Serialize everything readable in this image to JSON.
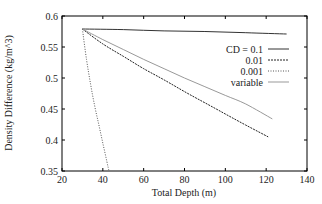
{
  "chart_data": {
    "type": "line",
    "title": "",
    "xlabel": "Total Depth (m)",
    "ylabel": "Density Difference (kg/m^3)",
    "xlim": [
      20,
      140
    ],
    "ylim": [
      0.35,
      0.6
    ],
    "xticks": [
      20,
      40,
      60,
      80,
      100,
      120,
      140
    ],
    "yticks": [
      0.35,
      0.4,
      0.45,
      0.5,
      0.55,
      0.6
    ],
    "xtick_labels": [
      "20",
      "40",
      "60",
      "80",
      "100",
      "120",
      "140"
    ],
    "ytick_labels": [
      "0.35",
      "0.4",
      "0.45",
      "0.5",
      "0.55",
      "0.6"
    ],
    "grid": false,
    "legend_position": "upper right (inside)",
    "series": [
      {
        "name": "CD = 0.1",
        "style": "solid",
        "color": "#333333",
        "x": [
          30,
          50,
          70,
          90,
          110,
          130
        ],
        "y": [
          0.579,
          0.578,
          0.576,
          0.575,
          0.573,
          0.571
        ]
      },
      {
        "name": "0.01",
        "style": "dashed",
        "color": "#222222",
        "x": [
          30,
          40,
          50,
          60,
          70,
          80,
          90,
          100,
          110,
          121
        ],
        "y": [
          0.579,
          0.555,
          0.535,
          0.515,
          0.497,
          0.478,
          0.46,
          0.442,
          0.424,
          0.405
        ]
      },
      {
        "name": "0.001",
        "style": "dotted",
        "color": "#555555",
        "x": [
          30,
          32,
          34,
          36,
          38,
          40,
          42,
          43
        ],
        "y": [
          0.579,
          0.53,
          0.49,
          0.455,
          0.425,
          0.395,
          0.365,
          0.35
        ]
      },
      {
        "name": "variable",
        "style": "solid-light",
        "color": "#999999",
        "x": [
          30,
          40,
          50,
          60,
          70,
          80,
          90,
          100,
          110,
          123
        ],
        "y": [
          0.579,
          0.562,
          0.546,
          0.53,
          0.515,
          0.5,
          0.486,
          0.472,
          0.458,
          0.434
        ]
      }
    ]
  },
  "legend": {
    "items": [
      {
        "label": "CD = 0.1"
      },
      {
        "label": "0.01"
      },
      {
        "label": "0.001"
      },
      {
        "label": "variable"
      }
    ]
  },
  "axes": {
    "xlabel": "Total Depth (m)",
    "ylabel": "Density Difference (kg/m^3)",
    "xticks": [
      "20",
      "40",
      "60",
      "80",
      "100",
      "120",
      "140"
    ],
    "yticks": [
      "0.35",
      "0.4",
      "0.45",
      "0.5",
      "0.55",
      "0.6"
    ]
  }
}
